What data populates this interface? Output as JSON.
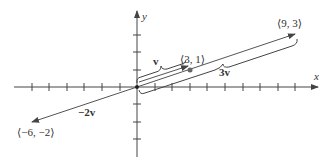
{
  "diagram": {
    "axes": {
      "x_label": "x",
      "y_label": "y",
      "origin_px": [
        137,
        87
      ],
      "unit_px": 17.6,
      "x_ticks": [
        -7,
        -6,
        -5,
        -4,
        -3,
        -2,
        -1,
        1,
        2,
        3,
        4,
        5,
        6,
        7,
        8,
        9
      ],
      "y_ticks": [
        -3,
        -2,
        -1,
        1,
        2,
        3
      ]
    },
    "vectors": [
      {
        "name": "v",
        "label": "v",
        "endpoint": [
          3,
          1
        ],
        "endpoint_label": "⟨3, 1⟩"
      },
      {
        "name": "3v",
        "label": "3v",
        "endpoint": [
          9,
          3
        ],
        "endpoint_label": "⟨9, 3⟩"
      },
      {
        "name": "-2v",
        "label": "−2v",
        "endpoint": [
          -6,
          -2
        ],
        "endpoint_label": "⟨−6, −2⟩"
      }
    ],
    "colors": {
      "axis": "#444444",
      "vector": "#555555",
      "point": "#666666",
      "text": "#333333"
    }
  }
}
